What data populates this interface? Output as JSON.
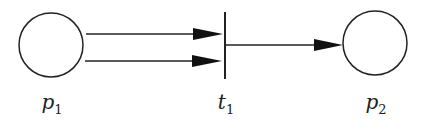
{
  "diagram": {
    "type": "petri-net",
    "places": [
      {
        "id": "p1",
        "label": "p",
        "sub": "1",
        "cx": 51,
        "cy": 45,
        "r": 32
      },
      {
        "id": "p2",
        "label": "p",
        "sub": "2",
        "cx": 375,
        "cy": 43,
        "r": 32
      }
    ],
    "transitions": [
      {
        "id": "t1",
        "label": "t",
        "sub": "1",
        "x": 225,
        "y1": 12,
        "y2": 79
      }
    ],
    "arcs": [
      {
        "from": "p1",
        "to": "t1",
        "y": 34
      },
      {
        "from": "p1",
        "to": "t1",
        "y": 61
      },
      {
        "from": "t1",
        "to": "p2",
        "y": 45
      }
    ],
    "colors": {
      "stroke": "#222222",
      "background": "#ffffff"
    }
  }
}
